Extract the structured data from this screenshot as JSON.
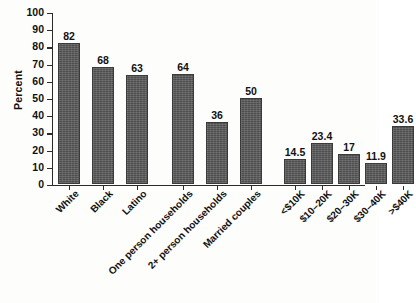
{
  "chart_data": {
    "type": "bar",
    "title": "",
    "subtitle": "",
    "xlabel": "",
    "ylabel": "Percent",
    "ylim": [
      0,
      100
    ],
    "yticks": [
      0,
      10,
      20,
      30,
      40,
      50,
      60,
      70,
      80,
      90,
      100
    ],
    "ytick_labels": [
      "0",
      "10",
      "20",
      "30",
      "40",
      "50",
      "60",
      "70",
      "80",
      "90",
      "100"
    ],
    "grid": false,
    "legend": null,
    "bar_color": "#575757",
    "categories": [
      "White",
      "Black",
      "Latino",
      "One person households",
      "2+ person households",
      "Married couples",
      "<$10K",
      "$10–20K",
      "$20–30K",
      "$30–40K",
      ">$40K"
    ],
    "values": [
      82,
      68,
      63,
      64,
      36,
      50,
      14.5,
      23.4,
      17,
      11.9,
      33.6
    ],
    "value_labels": [
      "82",
      "68",
      "63",
      "64",
      "36",
      "50",
      "14.5",
      "23.4",
      "17",
      "11.9",
      "33.6"
    ],
    "groups": [
      {
        "name": "race-ethnicity",
        "indices": [
          0,
          1,
          2
        ]
      },
      {
        "name": "household-type",
        "indices": [
          3,
          4,
          5
        ]
      },
      {
        "name": "household-income",
        "indices": [
          6,
          7,
          8,
          9,
          10
        ]
      }
    ],
    "bars": [
      {
        "label": "White",
        "value": 82,
        "value_label": "82",
        "x": 6,
        "width": 22
      },
      {
        "label": "Black",
        "value": 68,
        "value_label": "68",
        "x": 40,
        "width": 22
      },
      {
        "label": "Latino",
        "value": 63,
        "value_label": "63",
        "x": 74,
        "width": 22
      },
      {
        "label": "One person households",
        "value": 64,
        "value_label": "64",
        "x": 120,
        "width": 22
      },
      {
        "label": "2+ person households",
        "value": 36,
        "value_label": "36",
        "x": 154,
        "width": 22
      },
      {
        "label": "Married couples",
        "value": 50,
        "value_label": "50",
        "x": 188,
        "width": 22
      },
      {
        "label": "<$10K",
        "value": 14.5,
        "value_label": "14.5",
        "x": 232,
        "width": 22
      },
      {
        "label": "$10–20K",
        "value": 23.4,
        "value_label": "23.4",
        "x": 259,
        "width": 22
      },
      {
        "label": "$20–30K",
        "value": 17,
        "value_label": "17",
        "x": 286,
        "width": 22
      },
      {
        "label": "$30–40K",
        "value": 11.9,
        "value_label": "11.9",
        "x": 313,
        "width": 22
      },
      {
        "label": ">$40K",
        "value": 33.6,
        "value_label": "33.6",
        "x": 340,
        "width": 22
      }
    ]
  }
}
